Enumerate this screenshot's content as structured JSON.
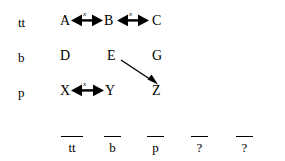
{
  "diagram": {
    "background_color": "#ffffff",
    "stroke_color": "#000000",
    "row_labels": [
      {
        "text": "tt",
        "x": 18,
        "y": 22
      },
      {
        "text": "b",
        "x": 18,
        "y": 57
      },
      {
        "text": "p",
        "x": 18,
        "y": 92
      }
    ],
    "nodes": [
      {
        "id": "A",
        "text": "A",
        "x": 60,
        "y": 20
      },
      {
        "id": "B",
        "text": "B",
        "x": 104,
        "y": 20
      },
      {
        "id": "C",
        "text": "C",
        "x": 152,
        "y": 20
      },
      {
        "id": "D",
        "text": "D",
        "x": 60,
        "y": 55
      },
      {
        "id": "E",
        "text": "E",
        "x": 107,
        "y": 55
      },
      {
        "id": "G",
        "text": "G",
        "x": 152,
        "y": 55
      },
      {
        "id": "X",
        "text": "X",
        "x": 60,
        "y": 90
      },
      {
        "id": "Y",
        "text": "Y",
        "x": 105,
        "y": 90
      },
      {
        "id": "Z",
        "text": "Z",
        "x": 152,
        "y": 90
      }
    ],
    "double_arrows": [
      {
        "name": "arrow-a-b",
        "from": "A",
        "to": "B",
        "label": "x",
        "x1": 72,
        "x2": 103,
        "y": 20,
        "label_x": 83,
        "label_y": 13
      },
      {
        "name": "arrow-b-c",
        "from": "B",
        "to": "C",
        "label": "x",
        "x1": 117,
        "x2": 149,
        "y": 20,
        "label_x": 129,
        "label_y": 13
      },
      {
        "name": "arrow-x-y",
        "from": "X",
        "to": "Y",
        "label": "x",
        "x1": 72,
        "x2": 104,
        "y": 90,
        "label_x": 83,
        "label_y": 83
      }
    ],
    "diagonal_arrows": [
      {
        "name": "arrow-e-z",
        "from": "E",
        "to": "Z",
        "x1": 121,
        "y1": 60,
        "x2": 157,
        "y2": 84
      }
    ],
    "bottom_slots": [
      {
        "text": "tt",
        "x": 68,
        "y": 146,
        "bar_x": 61,
        "bar_y": 136,
        "bar_w": 22
      },
      {
        "text": "b",
        "x": 111,
        "y": 146,
        "bar_x": 104,
        "bar_y": 136,
        "bar_w": 17
      },
      {
        "text": "p",
        "x": 154,
        "y": 146,
        "bar_x": 147,
        "bar_y": 136,
        "bar_w": 17
      },
      {
        "text": "?",
        "x": 198,
        "y": 146,
        "bar_x": 191,
        "bar_y": 136,
        "bar_w": 17
      },
      {
        "text": "?",
        "x": 243,
        "y": 146,
        "bar_x": 236,
        "bar_y": 136,
        "bar_w": 17
      }
    ]
  }
}
